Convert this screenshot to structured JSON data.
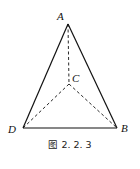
{
  "figure": {
    "caption": "图 2. 2. 3",
    "vertices": {
      "A": {
        "label": "A",
        "x": 68,
        "y": 24
      },
      "B": {
        "label": "B",
        "x": 117,
        "y": 128
      },
      "C": {
        "label": "C",
        "x": 69,
        "y": 84
      },
      "D": {
        "label": "D",
        "x": 23,
        "y": 128
      }
    },
    "solid_edges": [
      "AB",
      "AD",
      "DB"
    ],
    "dashed_edges": [
      "AC",
      "CB",
      "CD"
    ]
  }
}
